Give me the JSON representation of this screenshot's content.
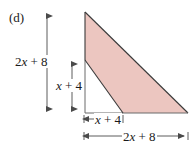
{
  "figure": {
    "part_label": "(d)",
    "shape": "right-triangle-with-inner-triangle-removed",
    "fill_color": "#ecc6c0",
    "stroke_color": "#3a3a3a",
    "dimension_line_color": "#4a4a4a",
    "background_color": "#ffffff"
  },
  "labels": {
    "height_total": "2x + 8",
    "height_total_parts": {
      "coef": "2",
      "var": "x",
      "op": "+",
      "const": "8"
    },
    "height_inner": "x + 4",
    "height_inner_parts": {
      "var": "x",
      "op": "+",
      "const": "4"
    },
    "width_inner": "x + 4",
    "width_inner_parts": {
      "var": "x",
      "op": "+",
      "const": "4"
    },
    "width_total": "2x + 8",
    "width_total_parts": {
      "coef": "2",
      "var": "x",
      "op": "+",
      "const": "8"
    }
  },
  "geometry": {
    "outer_triangle": {
      "apex": [
        85,
        12
      ],
      "bottom_left": [
        85,
        113
      ],
      "bottom_right": [
        188,
        113
      ]
    },
    "inner_triangle": {
      "apex": [
        85,
        60
      ],
      "bottom_left": [
        85,
        113
      ],
      "bottom_right": [
        123,
        113
      ]
    },
    "dimension_arrows": {
      "height_total": {
        "x": 47,
        "y_top": 12,
        "y_bottom": 113
      },
      "height_inner": {
        "x": 72,
        "y_top": 60,
        "y_bottom": 113
      },
      "width_inner": {
        "y": 119,
        "x_left": 84,
        "x_right": 123
      },
      "width_total": {
        "y": 136,
        "x_left": 84,
        "x_right": 188
      }
    }
  }
}
